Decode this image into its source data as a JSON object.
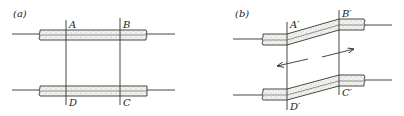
{
  "figure": {
    "panels": [
      {
        "id": "a",
        "label": "(a)",
        "points": {
          "top_left": "A",
          "top_right": "B",
          "bottom_right": "C",
          "bottom_left": "D"
        },
        "description": "Two parallel horizontal strips crossed by two vertical lines forming rectangle ABCD"
      },
      {
        "id": "b",
        "label": "(b)",
        "points": {
          "top_left": "A′",
          "top_right": "B′",
          "bottom_right": "C′",
          "bottom_left": "D′"
        },
        "description": "Strips sheared between the vertical lines, forming parallelogram A′B′C′D′; opposing arrows indicate shear"
      }
    ],
    "arrows": [
      {
        "direction": "left",
        "panel": "b"
      },
      {
        "direction": "right",
        "panel": "b"
      }
    ],
    "colors": {
      "line": "#333333",
      "fill": "#f1f1ee",
      "background": "#ffffff"
    }
  }
}
